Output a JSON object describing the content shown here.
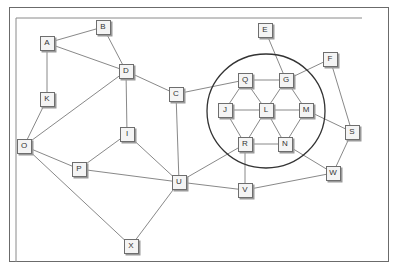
{
  "diagram": {
    "type": "network-graph",
    "colors": {
      "edge": "#7a7a7a",
      "circle": "#333333",
      "node_fill": "#f4f4f4",
      "node_border": "#6e6e6e"
    },
    "cluster": {
      "cx": 266,
      "cy": 111,
      "rx": 59,
      "ry": 57
    },
    "nodes": [
      {
        "id": "A",
        "x": 47,
        "y": 43
      },
      {
        "id": "B",
        "x": 103,
        "y": 27
      },
      {
        "id": "D",
        "x": 126,
        "y": 71
      },
      {
        "id": "K",
        "x": 47,
        "y": 99
      },
      {
        "id": "O",
        "x": 24,
        "y": 146
      },
      {
        "id": "C",
        "x": 176,
        "y": 94
      },
      {
        "id": "I",
        "x": 127,
        "y": 134
      },
      {
        "id": "P",
        "x": 79,
        "y": 169
      },
      {
        "id": "U",
        "x": 179,
        "y": 182
      },
      {
        "id": "X",
        "x": 131,
        "y": 246
      },
      {
        "id": "E",
        "x": 265,
        "y": 30
      },
      {
        "id": "F",
        "x": 330,
        "y": 59
      },
      {
        "id": "Q",
        "x": 245,
        "y": 80
      },
      {
        "id": "G",
        "x": 286,
        "y": 80
      },
      {
        "id": "J",
        "x": 225,
        "y": 110
      },
      {
        "id": "L",
        "x": 266,
        "y": 110
      },
      {
        "id": "M",
        "x": 306,
        "y": 110
      },
      {
        "id": "S",
        "x": 352,
        "y": 132
      },
      {
        "id": "R",
        "x": 245,
        "y": 144
      },
      {
        "id": "N",
        "x": 285,
        "y": 144
      },
      {
        "id": "V",
        "x": 245,
        "y": 190
      },
      {
        "id": "W",
        "x": 333,
        "y": 173
      }
    ],
    "edges": [
      [
        "A",
        "B"
      ],
      [
        "A",
        "D"
      ],
      [
        "A",
        "K"
      ],
      [
        "B",
        "D"
      ],
      [
        "D",
        "C"
      ],
      [
        "D",
        "I"
      ],
      [
        "D",
        "O"
      ],
      [
        "K",
        "O"
      ],
      [
        "O",
        "P"
      ],
      [
        "O",
        "X"
      ],
      [
        "P",
        "I"
      ],
      [
        "P",
        "U"
      ],
      [
        "I",
        "U"
      ],
      [
        "C",
        "U"
      ],
      [
        "C",
        "Q"
      ],
      [
        "U",
        "R"
      ],
      [
        "U",
        "V"
      ],
      [
        "U",
        "X"
      ],
      [
        "R",
        "V"
      ],
      [
        "V",
        "W"
      ],
      [
        "E",
        "G"
      ],
      [
        "F",
        "G"
      ],
      [
        "F",
        "S"
      ],
      [
        "M",
        "S"
      ],
      [
        "S",
        "W"
      ],
      [
        "N",
        "W"
      ],
      [
        "Q",
        "G"
      ],
      [
        "Q",
        "J"
      ],
      [
        "Q",
        "L"
      ],
      [
        "G",
        "L"
      ],
      [
        "G",
        "M"
      ],
      [
        "J",
        "L"
      ],
      [
        "L",
        "M"
      ],
      [
        "J",
        "R"
      ],
      [
        "L",
        "R"
      ],
      [
        "L",
        "N"
      ],
      [
        "M",
        "N"
      ],
      [
        "R",
        "N"
      ]
    ]
  }
}
